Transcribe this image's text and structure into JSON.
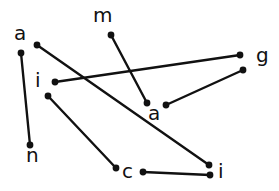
{
  "diagram": {
    "type": "hand-drawn letter matching",
    "nodes": [
      {
        "id": "a1",
        "letter": "a",
        "label_x": 14,
        "label_y": 40,
        "dot_x": 21,
        "dot_y": 53
      },
      {
        "id": "a1r",
        "letter": "",
        "label_x": 0,
        "label_y": 0,
        "dot_x": 37,
        "dot_y": 45
      },
      {
        "id": "m",
        "letter": "m",
        "label_x": 93,
        "label_y": 22,
        "dot_x": 111,
        "dot_y": 35
      },
      {
        "id": "i1",
        "letter": "i",
        "label_x": 35,
        "label_y": 87,
        "dot_x": 55,
        "dot_y": 82
      },
      {
        "id": "i1b",
        "letter": "",
        "label_x": 0,
        "label_y": 0,
        "dot_x": 48,
        "dot_y": 96
      },
      {
        "id": "g",
        "letter": "g",
        "label_x": 256,
        "label_y": 62,
        "dot_x": 240,
        "dot_y": 55
      },
      {
        "id": "g2",
        "letter": "",
        "label_x": 0,
        "label_y": 0,
        "dot_x": 243,
        "dot_y": 70
      },
      {
        "id": "a2",
        "letter": "a",
        "label_x": 148,
        "label_y": 120,
        "dot_x": 147,
        "dot_y": 103
      },
      {
        "id": "a2r",
        "letter": "",
        "label_x": 0,
        "label_y": 0,
        "dot_x": 166,
        "dot_y": 105
      },
      {
        "id": "n",
        "letter": "n",
        "label_x": 26,
        "label_y": 162,
        "dot_x": 30,
        "dot_y": 145
      },
      {
        "id": "c",
        "letter": "c",
        "label_x": 122,
        "label_y": 178,
        "dot_x": 116,
        "dot_y": 168
      },
      {
        "id": "c2",
        "letter": "",
        "label_x": 0,
        "label_y": 0,
        "dot_x": 143,
        "dot_y": 172
      },
      {
        "id": "i2",
        "letter": "i",
        "label_x": 218,
        "label_y": 178,
        "dot_x": 209,
        "dot_y": 165
      },
      {
        "id": "i2b",
        "letter": "",
        "label_x": 0,
        "label_y": 0,
        "dot_x": 210,
        "dot_y": 175
      }
    ],
    "edges": [
      {
        "from": "a1",
        "to": "n"
      },
      {
        "from": "a1r",
        "to": "i2"
      },
      {
        "from": "m",
        "to": "a2"
      },
      {
        "from": "i1",
        "to": "g"
      },
      {
        "from": "i1b",
        "to": "c"
      },
      {
        "from": "g2",
        "to": "a2r"
      },
      {
        "from": "c2",
        "to": "i2b"
      }
    ],
    "labels": [
      "a",
      "m",
      "i",
      "g",
      "a",
      "n",
      "c",
      "i"
    ]
  }
}
